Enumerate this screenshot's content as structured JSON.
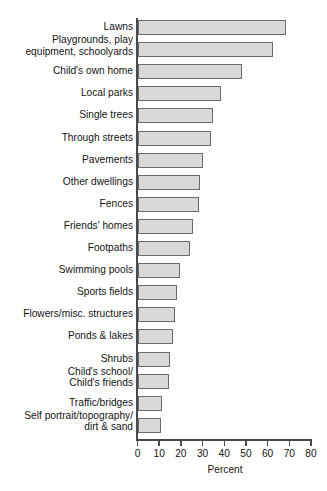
{
  "chart_data": {
    "type": "bar",
    "orientation": "horizontal",
    "title": "",
    "xlabel": "Percent",
    "ylabel": "",
    "xlim": [
      0,
      80
    ],
    "xticks": [
      0,
      10,
      20,
      30,
      40,
      50,
      60,
      70,
      80
    ],
    "grid": false,
    "legend": null,
    "bar_color": "#d9d9d9",
    "bar_border_color": "#6b6b6b",
    "axis_color": "#4a4a4a",
    "categories": [
      "Lawns",
      "Playgrounds, play\nequipment, schoolyards",
      "Child's own home",
      "Local parks",
      "Single trees",
      "Through streets",
      "Pavements",
      "Other dwellings",
      "Fences",
      "Friends' homes",
      "Footpaths",
      "Swimming pools",
      "Sports fields",
      "Flowers/misc. structures",
      "Ponds & lakes",
      "Shrubs",
      "Child's school/\nChild's friends",
      "Traffic/bridges",
      "Self portrait/topography/\ndirt & sand"
    ],
    "values": [
      68.5,
      62.5,
      48.0,
      38.5,
      35.0,
      34.0,
      30.0,
      28.8,
      28.5,
      25.4,
      24.4,
      19.4,
      18.3,
      17.3,
      16.4,
      14.8,
      14.3,
      11.5,
      11.0
    ]
  }
}
